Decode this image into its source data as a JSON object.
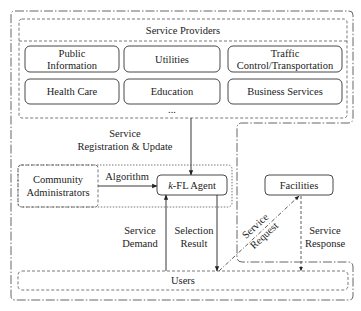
{
  "diagram": {
    "service_providers": {
      "title": "Service Providers",
      "services": [
        {
          "name": "public-information",
          "lines": [
            "Public",
            "Information"
          ]
        },
        {
          "name": "utilities",
          "lines": [
            "Utilities"
          ]
        },
        {
          "name": "traffic-control-transportation",
          "lines": [
            "Traffic",
            "Control/Transportation"
          ]
        },
        {
          "name": "health-care",
          "lines": [
            "Health Care"
          ]
        },
        {
          "name": "education",
          "lines": [
            "Education"
          ]
        },
        {
          "name": "business-services",
          "lines": [
            "Business Services"
          ]
        }
      ],
      "more": "..."
    },
    "registration_label": [
      "Service",
      "Registration & Update"
    ],
    "community_administrators": [
      "Community",
      "Administrators"
    ],
    "algorithm_label": "Algorithm",
    "agent": {
      "prefix": "k",
      "suffix": "-FL Agent"
    },
    "facilities": "Facilities",
    "service_demand": [
      "Service",
      "Demand"
    ],
    "selection_result": [
      "Selection",
      "Result"
    ],
    "service_request": [
      "Service",
      "Request"
    ],
    "service_response": [
      "Service",
      "Response"
    ],
    "users": "Users",
    "colors": {
      "background": "#ffffff",
      "line": "#333333",
      "text": "#222222"
    }
  }
}
